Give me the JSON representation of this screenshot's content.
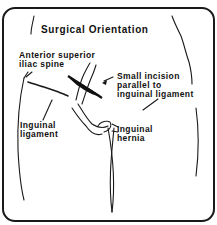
{
  "figure": {
    "title": "Surgical Orientation",
    "labels": {
      "anterior_superior_iliac_spine": [
        "Anterior superior",
        "iliac spine"
      ],
      "small_incision": [
        "Small incision",
        "parallel to",
        "inguinal ligament"
      ],
      "inguinal_ligament": [
        "Inguinal",
        "ligament"
      ],
      "inguinal_hernia": [
        "Inguinal",
        "hernia"
      ]
    },
    "colors": {
      "ink": "#111111",
      "background": "#ffffff"
    }
  }
}
